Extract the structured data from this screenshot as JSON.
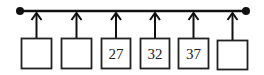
{
  "diagram": {
    "type": "array-pointer-diagram",
    "line": {
      "y": 11,
      "x_start": 20,
      "x_end": 246,
      "color": "#111111"
    },
    "endpoints": [
      {
        "name": "left-dot",
        "x": 20,
        "y": 11
      },
      {
        "name": "right-dot",
        "x": 246,
        "y": 11
      }
    ],
    "boxes": [
      {
        "x": 21,
        "label": ""
      },
      {
        "x": 61,
        "label": ""
      },
      {
        "x": 101,
        "label": "27"
      },
      {
        "x": 140,
        "label": "32"
      },
      {
        "x": 178,
        "label": "37"
      },
      {
        "x": 217,
        "label": ""
      }
    ],
    "box_top": 38,
    "box_size": 31
  },
  "labels": {
    "box0": "",
    "box1": "",
    "box2": "27",
    "box3": "32",
    "box4": "37",
    "box5": ""
  }
}
